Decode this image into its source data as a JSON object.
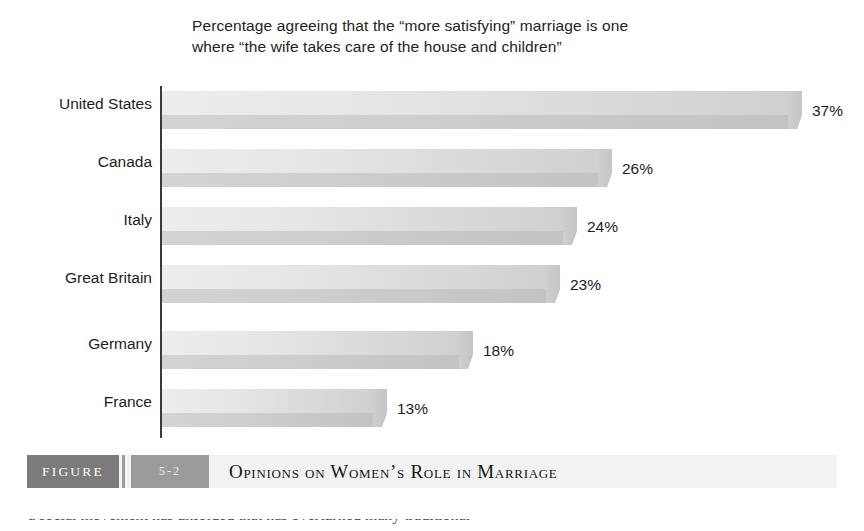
{
  "chart_data": {
    "type": "bar",
    "orientation": "horizontal",
    "title": "Percentage agreeing that the “more satisfying” marriage is one where “the wife takes care of the house and children”",
    "title_line_1": "Percentage agreeing that the “more satisfying” marriage is one",
    "title_line_2": "where “the wife takes care of the house and children”",
    "xlabel": "",
    "ylabel": "",
    "xlim": [
      0,
      40
    ],
    "grid": false,
    "legend": "none",
    "categories": [
      "United States",
      "Canada",
      "Italy",
      "Great Britain",
      "Germany",
      "France"
    ],
    "values": [
      37,
      26,
      24,
      23,
      18,
      13
    ],
    "value_labels": [
      "37%",
      "26%",
      "24%",
      "23%",
      "18%",
      "13%"
    ],
    "bars": [
      {
        "category": "United States",
        "value": 37,
        "label": "37%"
      },
      {
        "category": "Canada",
        "value": 26,
        "label": "26%"
      },
      {
        "category": "Italy",
        "value": 24,
        "label": "24%"
      },
      {
        "category": "Great Britain",
        "value": 23,
        "label": "23%"
      },
      {
        "category": "Germany",
        "value": 18,
        "label": "18%"
      },
      {
        "category": "France",
        "value": 13,
        "label": "13%"
      }
    ]
  },
  "figure_caption": {
    "figure_word": "FIGURE",
    "figure_number": "5-2",
    "title": "Opinions on Women’s Role in Marriage"
  },
  "colors": {
    "bar_light": "#eceded",
    "bar_dark": "#c2c3c4",
    "axis": "#3a3a3a",
    "caption_chip": "#7b7b7b",
    "caption_number_chip": "#9b9b9b",
    "caption_background": "#f2f2f2",
    "text": "#1d1d1d"
  },
  "cropped_body_text": "a social movement has unfolded that has overturned many traditional"
}
